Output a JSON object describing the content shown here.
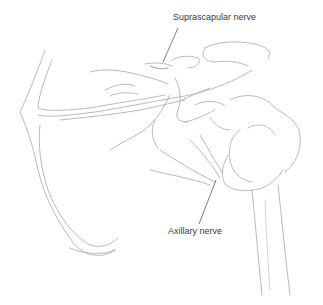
{
  "figure": {
    "background": "#ffffff",
    "stroke_color": "#9a9a9a",
    "label_color": "#3a3a3a"
  },
  "labels": [
    {
      "id": "suprascapular",
      "text": "Suprascapular nerve"
    },
    {
      "id": "axillary",
      "text": "Axillary nerve"
    }
  ]
}
